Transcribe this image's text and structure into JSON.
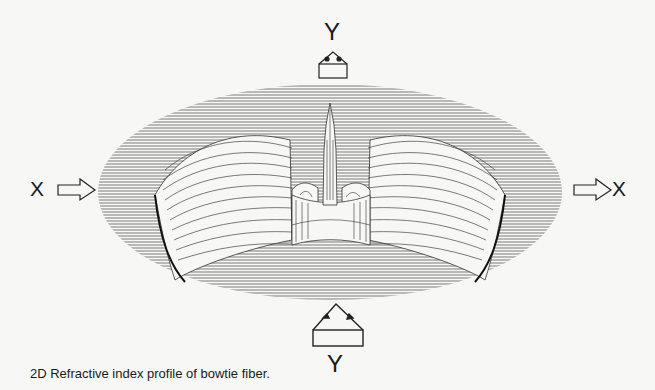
{
  "figure": {
    "caption": "2D Refractive index profile of bowtie fiber.",
    "axes": {
      "y_top_label": "Y",
      "y_bottom_label": "Y",
      "x_left_label": "X",
      "x_right_label": "X"
    },
    "plot_type": "3D wireframe surface (refractive index profile)",
    "features": {
      "central_peak": "core",
      "side_lobes": "bowtie stress regions",
      "colors": {
        "line": "#333333",
        "background": "#f7f7f5"
      }
    }
  }
}
